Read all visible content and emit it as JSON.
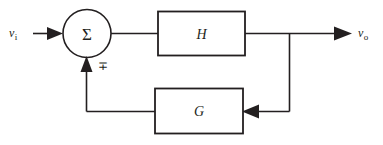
{
  "diagram": {
    "type": "feedback-control-block-diagram",
    "background_color": "#ffffff",
    "line_color": "#231f20",
    "input": {
      "symbol": "v",
      "subscript": "i",
      "full_label": "vi"
    },
    "output": {
      "symbol": "v",
      "subscript": "o",
      "full_label": "vo"
    },
    "summing_junction": {
      "name": "summing-junction",
      "glyph": "Σ",
      "shape": "circle",
      "feedback_sign": "∓"
    },
    "blocks": [
      {
        "id": "forward-gain",
        "label": "H",
        "position": "forward-path"
      },
      {
        "id": "feedback-gain",
        "label": "G",
        "position": "feedback-path"
      }
    ],
    "connections": [
      {
        "id": "input-to-sum",
        "from": "vi",
        "to": "summing-junction",
        "arrow": "right"
      },
      {
        "id": "sum-to-h",
        "from": "summing-junction",
        "to": "H",
        "arrow": "none"
      },
      {
        "id": "h-to-output",
        "from": "H",
        "to": "vo",
        "arrow": "right"
      },
      {
        "id": "output-tap-to-g",
        "from": "output-node",
        "to": "G",
        "arrow": "left"
      },
      {
        "id": "g-to-sum",
        "from": "G",
        "to": "summing-junction",
        "arrow": "up"
      }
    ]
  }
}
